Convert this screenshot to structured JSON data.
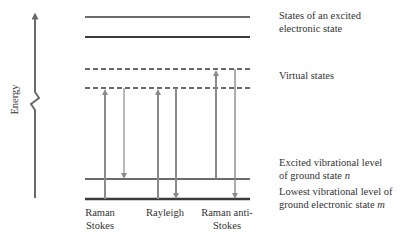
{
  "axis": {
    "label": "Energy"
  },
  "levels": {
    "excited_electronic": "States of an excited electronic state",
    "excited_electronic_line1": "States of an excited",
    "excited_electronic_line2": "electronic state",
    "virtual": "Virtual states",
    "excited_vibrational_line1": "Excited vibrational level",
    "excited_vibrational_line2": "of ground state ",
    "excited_vibrational_var": "n",
    "lowest_vibrational_line1": "Lowest vibrational level of",
    "lowest_vibrational_line2": "ground electronic state ",
    "lowest_vibrational_var": "m"
  },
  "processes": [
    {
      "name": "Raman Stokes",
      "line1": "Raman",
      "line2": "Stokes"
    },
    {
      "name": "Rayleigh",
      "line1": "Rayleigh",
      "line2": ""
    },
    {
      "name": "Raman anti-Stokes",
      "line1": "Raman anti-",
      "line2": "Stokes"
    }
  ],
  "colors": {
    "line": "#3a3a3a",
    "arrow": "#8a8a8a",
    "axis": "#6a6a6a"
  }
}
